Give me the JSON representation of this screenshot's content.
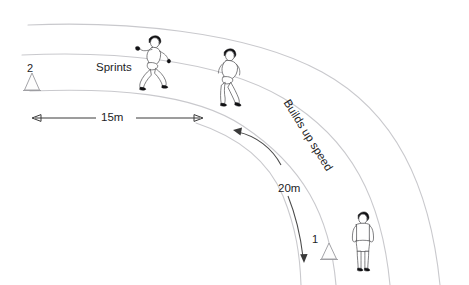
{
  "diagram": {
    "background_color": "#ffffff",
    "lane_line_color": "#c9c9cd",
    "text_color": "#1d1d1f",
    "arrow_color": "#3a3a3a"
  },
  "labels": {
    "sprints": "Sprints",
    "builds_up_speed": "Builds up speed",
    "distance_15m": "15m",
    "distance_20m": "20m",
    "cone_two": "2",
    "cone_one": "1"
  },
  "markers": [
    {
      "name": "cone-2",
      "label": "2",
      "x": 32,
      "y": 84
    },
    {
      "name": "cone-1",
      "label": "1",
      "x": 329,
      "y": 253
    }
  ],
  "figures": [
    {
      "name": "sprinting-runner-left",
      "pose": "sprinting",
      "x": 152,
      "y": 60
    },
    {
      "name": "sprinting-runner-right",
      "pose": "running",
      "x": 228,
      "y": 75
    },
    {
      "name": "standing-athlete",
      "pose": "standing",
      "x": 362,
      "y": 240
    }
  ],
  "measurements": [
    {
      "name": "fifteen-metres",
      "value": "15m",
      "type": "straight-double-arrow"
    },
    {
      "name": "twenty-metres",
      "value": "20m",
      "type": "curved-double-arrow"
    }
  ],
  "lanes": [
    {
      "name": "lane-line-1"
    },
    {
      "name": "lane-line-2"
    },
    {
      "name": "lane-line-3"
    },
    {
      "name": "lane-line-4"
    }
  ]
}
